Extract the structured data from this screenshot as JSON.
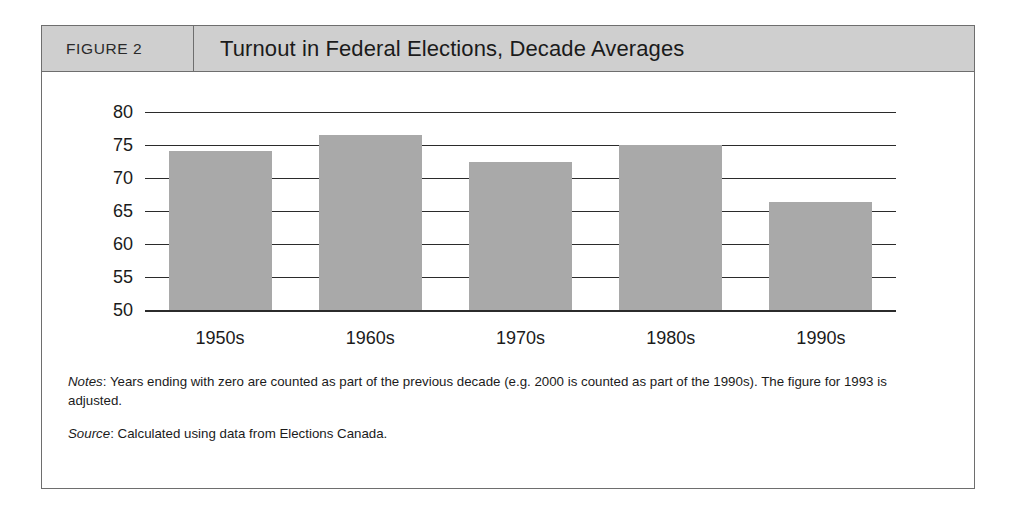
{
  "figure": {
    "number_label": "FIGURE 2",
    "title": "Turnout in Federal Elections, Decade Averages"
  },
  "notes": {
    "notes_lead": "Notes",
    "notes_text": ": Years ending with zero are counted as part of the previous decade (e.g. 2000 is counted as part of the 1990s). The figure for 1993 is adjusted.",
    "source_lead": "Source",
    "source_text": ": Calculated using data from Elections Canada."
  },
  "colors": {
    "bar_fill": "#a9a9a9",
    "header_band": "#cfcfcf",
    "frame_border": "#6e6e6e",
    "axis": "#2b2b2b"
  },
  "chart_data": {
    "type": "bar",
    "title": "Turnout in Federal Elections, Decade Averages",
    "xlabel": "",
    "ylabel": "",
    "categories": [
      "1950s",
      "1960s",
      "1970s",
      "1980s",
      "1990s"
    ],
    "values": [
      74.1,
      76.5,
      72.5,
      75.0,
      66.3
    ],
    "ylim": [
      50,
      80
    ],
    "yticks": [
      50,
      55,
      60,
      65,
      70,
      75,
      80
    ],
    "ytick_labels": [
      "50",
      "55",
      "60",
      "65",
      "70",
      "75",
      "80"
    ],
    "grid": true,
    "legend": false,
    "series": [
      {
        "name": "Average turnout (%)",
        "values": [
          74.1,
          76.5,
          72.5,
          75.0,
          66.3
        ]
      }
    ]
  }
}
